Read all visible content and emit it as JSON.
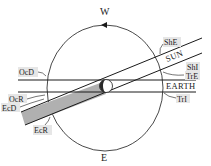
{
  "diagram": {
    "directions": {
      "top": "W",
      "bottom": "E"
    },
    "bodies": {
      "sun": "SUN",
      "earth": "EARTH"
    },
    "labels": {
      "she": "ShE",
      "shi": "ShI",
      "tre": "TrE",
      "tri": "TrI",
      "ocd": "OcD",
      "ocr": "OcR",
      "ecd": "EcD",
      "ecr": "EcR"
    },
    "colors": {
      "line": "#1a1a1a",
      "shadow_fill": "#b0b0b0",
      "label_bg": "#e6e6e6",
      "planet_dark": "#2a2a2a"
    }
  }
}
